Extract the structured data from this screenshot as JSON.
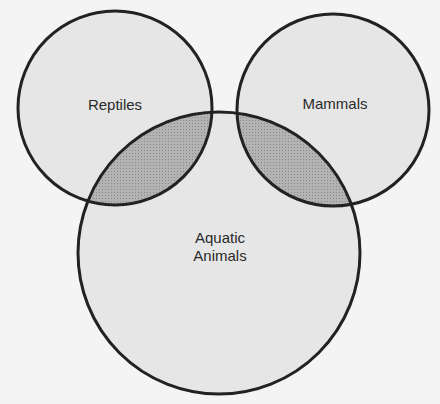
{
  "diagram": {
    "type": "venn",
    "colors": {
      "background": "#f4f4f4",
      "circle_fill": "#e6e6e6",
      "overlap_fill": "#a9a9a9",
      "stroke": "#222222"
    },
    "sets": [
      {
        "id": "reptiles",
        "label": "Reptiles",
        "cx": 115,
        "cy": 108,
        "r": 97
      },
      {
        "id": "mammals",
        "label": "Mammals",
        "cx": 333,
        "cy": 110,
        "r": 96
      },
      {
        "id": "aquatic",
        "label": "Aquatic Animals",
        "label_line1": "Aquatic",
        "label_line2": "Animals",
        "cx": 219,
        "cy": 253,
        "r": 141
      }
    ],
    "shaded_regions": [
      {
        "sets": [
          "reptiles",
          "aquatic"
        ],
        "shaded": true
      },
      {
        "sets": [
          "mammals",
          "aquatic"
        ],
        "shaded": true
      }
    ]
  }
}
